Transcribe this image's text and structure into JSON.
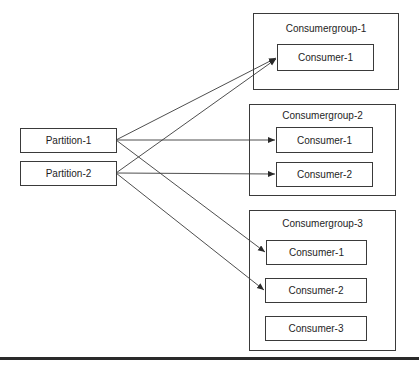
{
  "diagram": {
    "partitions": [
      {
        "id": "p1",
        "label": "Partition-1"
      },
      {
        "id": "p2",
        "label": "Partition-2"
      }
    ],
    "consumer_groups": [
      {
        "id": "cg1",
        "label": "Consumergroup-1",
        "consumers": [
          {
            "id": "cg1c1",
            "label": "Consumer-1"
          }
        ]
      },
      {
        "id": "cg2",
        "label": "Consumergroup-2",
        "consumers": [
          {
            "id": "cg2c1",
            "label": "Consumer-1"
          },
          {
            "id": "cg2c2",
            "label": "Consumer-2"
          }
        ]
      },
      {
        "id": "cg3",
        "label": "Consumergroup-3",
        "consumers": [
          {
            "id": "cg3c1",
            "label": "Consumer-1"
          },
          {
            "id": "cg3c2",
            "label": "Consumer-2"
          },
          {
            "id": "cg3c3",
            "label": "Consumer-3"
          }
        ]
      }
    ],
    "edges": [
      {
        "from": "Partition-1",
        "to": "Consumergroup-1 / Consumer-1"
      },
      {
        "from": "Partition-2",
        "to": "Consumergroup-1 / Consumer-1"
      },
      {
        "from": "Partition-1",
        "to": "Consumergroup-2 / Consumer-1"
      },
      {
        "from": "Partition-2",
        "to": "Consumergroup-2 / Consumer-2"
      },
      {
        "from": "Partition-1",
        "to": "Consumergroup-3 / Consumer-1"
      },
      {
        "from": "Partition-2",
        "to": "Consumergroup-3 / Consumer-2"
      }
    ],
    "colors": {
      "stroke": "#3a3a3a",
      "background": "#ffffff"
    }
  }
}
